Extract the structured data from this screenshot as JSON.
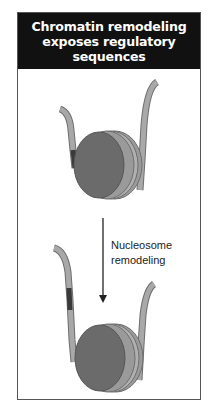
{
  "figure": {
    "title_lines": [
      "Chromatin remodeling",
      "exposes regulatory",
      "sequences"
    ],
    "arrow_label_lines": [
      "Nucleosome",
      "remodeling"
    ],
    "panels": [
      {
        "name": "before",
        "description": "DNA wrapped around nucleosome; regulatory segment hidden"
      },
      {
        "name": "after",
        "description": "Nucleosome slid; regulatory segment exposed on free DNA"
      }
    ],
    "colors": {
      "header_bg": "#111111",
      "header_text": "#ffffff",
      "histone_face": "#6b6b6b",
      "histone_edge": "#9a9a9a",
      "dna": "#a8a8a8",
      "dna_outline": "#6e6e6e",
      "regulatory_segment": "#3a3a3a",
      "frame_border": "#555555"
    }
  }
}
